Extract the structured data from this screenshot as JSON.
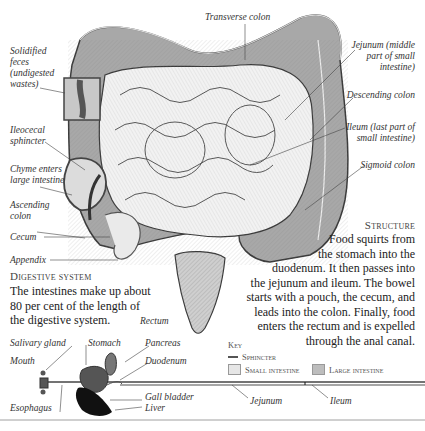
{
  "labels": {
    "transverse_colon": "Transverse colon",
    "solidified_feces": [
      "Solidified",
      "feces",
      "(undigested",
      "wastes)"
    ],
    "ileocecal_sphincter": [
      "Ileocecal",
      "sphincter"
    ],
    "chyme_enters": [
      "Chyme enters",
      "large intestine"
    ],
    "ascending_colon": [
      "Ascending",
      "colon"
    ],
    "cecum": "Cecum",
    "appendix": "Appendix",
    "jejunum_top": [
      "Jejunum (middle",
      "part of small",
      "intestine)"
    ],
    "descending_colon": "Descending colon",
    "ileum_top": [
      "Ileum (last part of",
      "small intestine)"
    ],
    "sigmoid_colon": "Sigmoid colon",
    "rectum": "Rectum"
  },
  "digestive_system": {
    "heading": "Digestive system",
    "text": [
      "The intestines make up about",
      "80 per cent of the length of",
      "the digestive system."
    ]
  },
  "structure": {
    "heading": "Structure",
    "text": [
      "Food squirts from",
      "the stomach into the",
      "duodenum. It then passes into",
      "the jejunum and ileum. The bowel",
      "starts with a pouch, the cecum, and",
      "leads into the colon. Finally, food",
      "enters the rectum and is expelled",
      "through the anal canal."
    ]
  },
  "key": {
    "heading": "Key",
    "items": [
      {
        "label": "Sphincter",
        "type": "line",
        "color": "#555555"
      },
      {
        "label": "Small intestine",
        "type": "swatch",
        "color": "#e6e6e6"
      },
      {
        "label": "Large intestine",
        "type": "swatch",
        "color": "#bdbdbd"
      }
    ]
  },
  "tract_labels": {
    "salivary_gland": "Salivary gland",
    "mouth": "Mouth",
    "stomach": "Stomach",
    "pancreas": "Pancreas",
    "duodenum": "Duodenum",
    "esophagus": "Esophagus",
    "gall_bladder": "Gall bladder",
    "liver": "Liver",
    "jejunum": "Jejunum",
    "ileum": "Ileum"
  },
  "colors": {
    "large_intestine": "#9a9a9a",
    "small_intestine": "#ececec",
    "outline": "#3a3a3a",
    "dark_organ": "#555555",
    "liver": "#111111"
  }
}
